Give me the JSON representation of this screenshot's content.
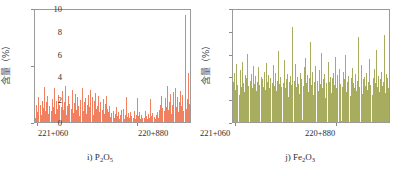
{
  "figure": {
    "background_color": "#ffffff",
    "panels": [
      {
        "id": "panel-i",
        "caption_prefix": "i)",
        "caption_formula_main": "P",
        "caption_sub1": "2",
        "caption_formula_mid": "O",
        "caption_sub2": "5",
        "caption_text": "i) P2O5",
        "series_color": "#F08060",
        "axis_color": "#9a9a9a",
        "ylabel": "含量（%）",
        "ytick_labels": [
          "2",
          "1",
          "0"
        ],
        "xtick_labels": [
          "221+060",
          "220+880"
        ],
        "chart_data": {
          "type": "bar",
          "title": "i) P2O5",
          "xlabel": "",
          "ylabel": "含量（%）",
          "ylim": [
            0,
            2
          ],
          "yticks": [
            0,
            1,
            2
          ],
          "grid": false,
          "legend": "none",
          "bar_color": "#F08060",
          "x_axis_type": "chainage",
          "x_tick_positions": [
            0.02,
            0.66
          ],
          "x_tick_labels": [
            "221+060",
            "220+880"
          ],
          "x_start_label": "221+060",
          "x_end_label": "220+880",
          "n_bars": 170,
          "values": [
            0.08,
            0.31,
            0.18,
            0.44,
            0.22,
            0.56,
            0.3,
            0.12,
            0.38,
            0.25,
            0.62,
            0.2,
            0.35,
            0.47,
            0.15,
            0.28,
            0.52,
            0.33,
            0.19,
            0.41,
            0.26,
            0.6,
            0.14,
            0.37,
            0.23,
            0.49,
            0.31,
            0.17,
            0.43,
            0.27,
            0.55,
            0.21,
            0.36,
            0.64,
            0.13,
            0.29,
            0.46,
            0.32,
            0.18,
            0.4,
            0.24,
            0.58,
            0.16,
            0.34,
            0.5,
            0.22,
            0.45,
            0.28,
            0.11,
            0.39,
            0.53,
            0.25,
            0.61,
            0.19,
            0.35,
            0.42,
            0.15,
            0.3,
            0.48,
            0.26,
            0.57,
            0.2,
            0.33,
            0.44,
            0.12,
            0.38,
            0.51,
            0.23,
            0.29,
            0.46,
            0.17,
            0.36,
            0.27,
            0.59,
            0.21,
            0.41,
            0.14,
            0.32,
            0.47,
            0.24,
            0.18,
            0.28,
            0.09,
            0.16,
            0.22,
            0.11,
            0.19,
            0.07,
            0.14,
            0.26,
            0.1,
            0.17,
            0.06,
            0.13,
            0.21,
            0.08,
            0.15,
            0.24,
            0.05,
            0.12,
            0.45,
            0.09,
            0.16,
            0.07,
            0.18,
            0.11,
            0.04,
            0.14,
            0.08,
            0.2,
            0.06,
            0.13,
            0.43,
            0.1,
            0.17,
            0.05,
            0.12,
            0.08,
            0.15,
            0.09,
            0.07,
            0.19,
            0.11,
            0.06,
            0.14,
            0.08,
            0.41,
            0.1,
            0.16,
            0.07,
            0.13,
            0.09,
            0.05,
            0.12,
            0.18,
            0.08,
            0.22,
            0.31,
            0.47,
            0.25,
            0.58,
            0.33,
            0.19,
            0.42,
            0.27,
            0.64,
            0.21,
            0.36,
            0.5,
            0.15,
            0.3,
            0.54,
            0.23,
            0.39,
            0.61,
            0.26,
            0.44,
            0.18,
            0.35,
            0.56,
            0.29,
            0.48,
            0.2,
            0.37,
            0.66,
            1.91,
            0.24,
            0.41,
            0.88,
            0.32
          ]
        }
      },
      {
        "id": "panel-j",
        "caption_prefix": "j)",
        "caption_formula_main": "Fe",
        "caption_sub1": "2",
        "caption_formula_mid": "O",
        "caption_sub2": "3",
        "caption_text": "j) Fe2O3",
        "series_color": "#A7AC5E",
        "axis_color": "#9a9a9a",
        "ylabel": "含量（%）",
        "ytick_labels": [
          "10",
          "8",
          "6",
          "4",
          "2",
          "0"
        ],
        "xtick_labels": [
          "221+060",
          "220+880"
        ],
        "chart_data": {
          "type": "bar",
          "title": "j) Fe2O3",
          "xlabel": "",
          "ylabel": "含量（%）",
          "ylim": [
            0,
            10
          ],
          "yticks": [
            0,
            2,
            4,
            6,
            8,
            10
          ],
          "grid": false,
          "legend": "none",
          "bar_color": "#A7AC5E",
          "x_axis_type": "chainage",
          "x_tick_positions": [
            0.02,
            0.66
          ],
          "x_tick_labels": [
            "221+060",
            "220+880"
          ],
          "x_start_label": "221+060",
          "x_end_label": "220+880",
          "n_bars": 170,
          "values": [
            3.6,
            4.4,
            2.9,
            5.2,
            3.3,
            4.0,
            3.8,
            2.4,
            4.6,
            3.1,
            5.4,
            3.5,
            2.7,
            4.2,
            3.9,
            6.1,
            3.2,
            4.8,
            2.6,
            3.7,
            4.3,
            3.0,
            5.0,
            3.4,
            4.1,
            2.8,
            3.6,
            4.9,
            3.3,
            5.6,
            2.5,
            4.0,
            3.8,
            3.1,
            4.5,
            2.9,
            5.3,
            3.6,
            4.2,
            3.0,
            3.9,
            4.7,
            2.3,
            3.5,
            5.1,
            3.2,
            4.4,
            2.8,
            3.7,
            6.3,
            3.4,
            4.0,
            3.1,
            2.6,
            4.8,
            3.5,
            5.5,
            3.0,
            3.8,
            4.3,
            2.2,
            3.6,
            4.1,
            3.3,
            8.5,
            4.6,
            2.9,
            3.7,
            5.2,
            3.1,
            4.0,
            3.4,
            2.5,
            4.4,
            3.8,
            0.2,
            3.2,
            4.9,
            3.0,
            5.7,
            3.5,
            4.2,
            2.7,
            3.9,
            7.1,
            3.3,
            4.5,
            2.4,
            3.6,
            5.0,
            3.1,
            4.1,
            3.7,
            2.8,
            4.6,
            3.4,
            6.2,
            3.0,
            3.8,
            4.3,
            2.1,
            3.5,
            4.9,
            3.2,
            5.4,
            3.6,
            4.0,
            2.6,
            3.9,
            4.4,
            3.3,
            5.8,
            3.0,
            4.2,
            2.9,
            3.7,
            4.7,
            3.4,
            0.1,
            3.1,
            4.5,
            3.8,
            6.0,
            2.7,
            3.6,
            4.1,
            3.2,
            5.3,
            2.3,
            3.9,
            4.8,
            3.5,
            3.0,
            4.3,
            2.8,
            3.7,
            7.6,
            3.1,
            4.6,
            3.4,
            5.1,
            2.5,
            3.8,
            4.0,
            3.2,
            4.4,
            2.9,
            3.6,
            5.6,
            3.3,
            4.2,
            3.0,
            2.4,
            3.9,
            4.7,
            3.5,
            6.4,
            3.1,
            4.1,
            2.7,
            3.8,
            4.5,
            3.2,
            5.0,
            3.6,
            7.8,
            2.6,
            4.3,
            3.9,
            3.0
          ]
        }
      }
    ]
  }
}
